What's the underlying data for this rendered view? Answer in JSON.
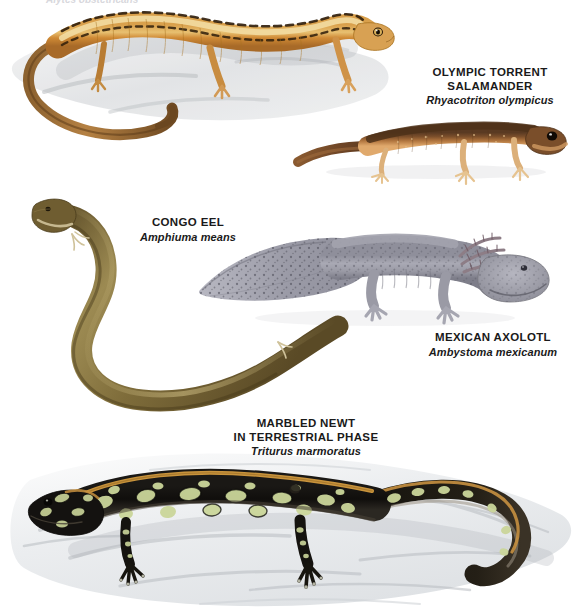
{
  "page": {
    "width": 577,
    "height": 611,
    "background": "#ffffff",
    "text_color": "#1a1a1a"
  },
  "top_cut_caption": {
    "text": "Alytes obstetricans",
    "note": "faint, cropped at top edge of page"
  },
  "specimens": [
    {
      "id": "long-tailed-salamander",
      "common_name": "",
      "scientific_name": "",
      "body_color": "#c98a3c",
      "stripe_color": "#3a2410",
      "belly_color": "#e8c98a",
      "facing": "right",
      "substrate": "gray rock",
      "position": {
        "x": 8,
        "y": 6,
        "width": 390,
        "height": 150
      }
    },
    {
      "id": "olympic-torrent-salamander",
      "common_name_line1": "OLYMPIC TORRENT",
      "common_name_line2": "SALAMANDER",
      "scientific_name": "Rhyacotriton olympicus",
      "body_color": "#6b4226",
      "belly_color": "#d9a168",
      "facing": "right",
      "label_position": {
        "x": 420,
        "y": 66,
        "width": 140
      },
      "position": {
        "x": 288,
        "y": 115,
        "width": 272,
        "height": 72
      }
    },
    {
      "id": "congo-eel",
      "common_name": "CONGO EEL",
      "scientific_name": "Amphiuma means",
      "body_color": "#7d6a3e",
      "highlight_color": "#b5a066",
      "facing": "up-left",
      "label_position": {
        "x": 128,
        "y": 216,
        "width": 120
      },
      "position": {
        "x": 30,
        "y": 196,
        "width": 290,
        "height": 215
      }
    },
    {
      "id": "mexican-axolotl",
      "common_name": "MEXICAN AXOLOTL",
      "scientific_name": "Ambystoma mexicanum",
      "body_color": "#9a9aa4",
      "speckle_color": "#4b4b55",
      "gill_color": "#8d7d86",
      "facing": "right",
      "label_position": {
        "x": 422,
        "y": 331,
        "width": 142
      },
      "position": {
        "x": 196,
        "y": 232,
        "width": 352,
        "height": 105
      }
    },
    {
      "id": "marbled-newt",
      "common_name_line1": "MARBLED NEWT",
      "common_name_line2": "IN TERRESTRIAL PHASE",
      "scientific_name": "Triturus marmoratus",
      "body_color": "#14120f",
      "marble_color": "#cbd69a",
      "dorsal_stripe_color": "#d29a3e",
      "facing": "left",
      "substrate": "white rock",
      "label_position": {
        "x": 230,
        "y": 417,
        "width": 152
      },
      "position": {
        "x": 40,
        "y": 450,
        "width": 537,
        "height": 161
      }
    }
  ],
  "palette": {
    "background": "#ffffff",
    "caption_text": "#1a1a1a",
    "rock_gray": "#b9bcc0",
    "rock_light": "#e9eaec"
  }
}
